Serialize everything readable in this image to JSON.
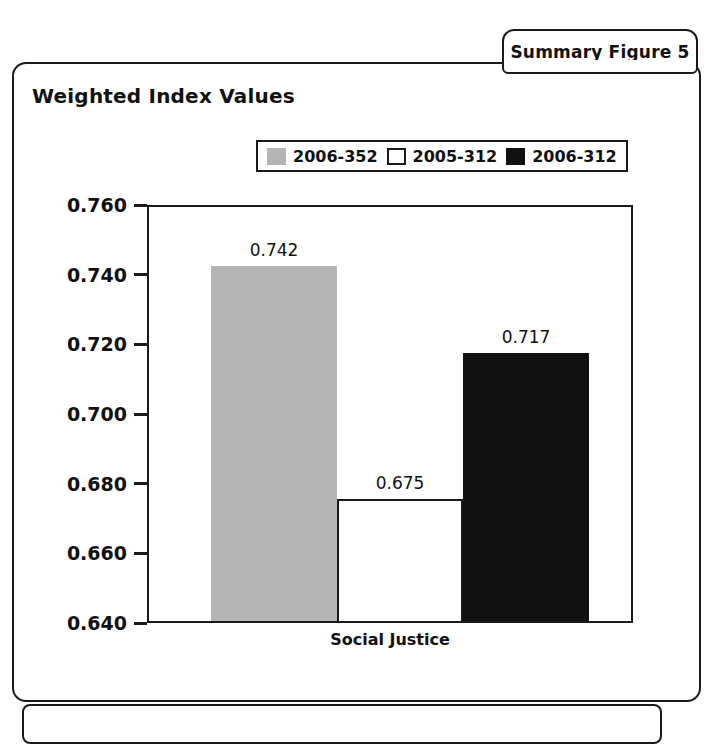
{
  "tab": {
    "label": "Summary Figure 5"
  },
  "chart": {
    "title": "Weighted Index Values"
  },
  "chart_data": {
    "type": "bar",
    "title": "Weighted Index Values",
    "xlabel": "",
    "ylabel": "",
    "categories": [
      "Social Justice"
    ],
    "ylim": [
      0.64,
      0.76
    ],
    "yticks": [
      "0.760",
      "0.740",
      "0.720",
      "0.700",
      "0.680",
      "0.660",
      "0.640"
    ],
    "ytick_values": [
      0.76,
      0.74,
      0.72,
      0.7,
      0.68,
      0.66,
      0.64
    ],
    "grid": false,
    "legend_position": "top-center",
    "series": [
      {
        "name": "2006-352",
        "color": "#b5b5b5",
        "values": [
          0.742
        ],
        "labels": [
          "0.742"
        ]
      },
      {
        "name": "2005-312",
        "color": "#ffffff",
        "values": [
          0.675
        ],
        "labels": [
          "0.675"
        ]
      },
      {
        "name": "2006-312",
        "color": "#111111",
        "values": [
          0.717
        ],
        "labels": [
          "0.717"
        ]
      }
    ]
  }
}
